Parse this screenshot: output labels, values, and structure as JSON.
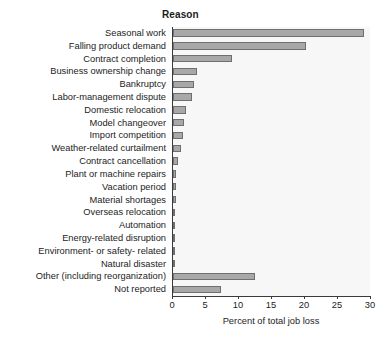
{
  "chart_data": {
    "type": "bar",
    "orientation": "horizontal",
    "title": "Reason",
    "xlabel": "Percent of total job loss",
    "ylabel": "",
    "xlim": [
      0,
      30
    ],
    "xticks": [
      0,
      5,
      10,
      15,
      20,
      25,
      30
    ],
    "xtick_labels": [
      "0",
      "5",
      "10",
      "15",
      "20",
      "25",
      "30"
    ],
    "grid": false,
    "legend": null,
    "bar_color": "#a8a8a8",
    "bar_edge_color": "#6f6f6f",
    "plot_background": "#f7f7f7",
    "categories": [
      "Seasonal work",
      "Falling product demand",
      "Contract completion",
      "Business ownership change",
      "Bankruptcy",
      "Labor-management dispute",
      "Domestic relocation",
      "Model changeover",
      "Import competition",
      "Weather-related curtailment",
      "Contract cancellation",
      "Plant or machine repairs",
      "Vacation period",
      "Material shortages",
      "Overseas relocation",
      "Automation",
      "Energy-related disruption",
      "Environment- or safety- related",
      "Natural disaster",
      "Other (including reorganization)",
      "Not reported"
    ],
    "values": [
      28.9,
      20.2,
      8.9,
      3.7,
      3.2,
      2.9,
      1.9,
      1.7,
      1.5,
      1.2,
      0.8,
      0.5,
      0.4,
      0.4,
      0.2,
      0.15,
      0.1,
      0.1,
      0.1,
      12.4,
      7.2
    ]
  }
}
